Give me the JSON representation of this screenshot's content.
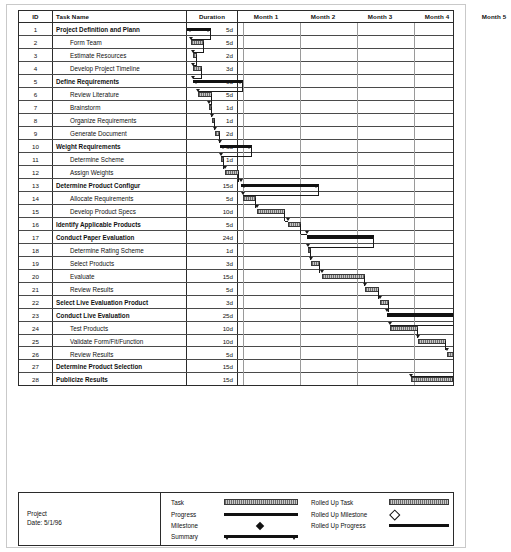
{
  "document": {
    "type": "gantt-chart",
    "project_label": "Project",
    "date_label": "Date: 5/1/96"
  },
  "table": {
    "headers": {
      "id": "ID",
      "task_name": "Task Name",
      "duration": "Duration"
    },
    "timescale": [
      "Month 1",
      "Month 2",
      "Month 3",
      "Month 4",
      "Month 5"
    ],
    "rows": [
      {
        "id": "1",
        "name": "Project Definition and Plann",
        "duration": "5d",
        "summary": true
      },
      {
        "id": "2",
        "name": "Form Team",
        "duration": "5d",
        "summary": false
      },
      {
        "id": "3",
        "name": "Estimate Resources",
        "duration": "2d",
        "summary": false
      },
      {
        "id": "4",
        "name": "Develop Project Timeline",
        "duration": "3d",
        "summary": false
      },
      {
        "id": "5",
        "name": "Define Requirements",
        "duration": "9d",
        "summary": true
      },
      {
        "id": "6",
        "name": "Review Literature",
        "duration": "5d",
        "summary": false
      },
      {
        "id": "7",
        "name": "Brainstorm",
        "duration": "1d",
        "summary": false
      },
      {
        "id": "8",
        "name": "Organize Requirements",
        "duration": "1d",
        "summary": false
      },
      {
        "id": "9",
        "name": "Generate Document",
        "duration": "2d",
        "summary": false
      },
      {
        "id": "10",
        "name": "Weight Requirements",
        "duration": "6d",
        "summary": true
      },
      {
        "id": "11",
        "name": "Determine Scheme",
        "duration": "1d",
        "summary": false
      },
      {
        "id": "12",
        "name": "Assign Weights",
        "duration": "5d",
        "summary": false
      },
      {
        "id": "13",
        "name": "Determine Product Configur",
        "duration": "15d",
        "summary": true
      },
      {
        "id": "14",
        "name": "Allocate Requirements",
        "duration": "5d",
        "summary": false
      },
      {
        "id": "15",
        "name": "Develop Product Specs",
        "duration": "10d",
        "summary": false
      },
      {
        "id": "16",
        "name": "Identify Applicable Products",
        "duration": "5d",
        "summary": true
      },
      {
        "id": "17",
        "name": "Conduct Paper Evaluation",
        "duration": "24d",
        "summary": true
      },
      {
        "id": "18",
        "name": "Determine Rating Scheme",
        "duration": "1d",
        "summary": false
      },
      {
        "id": "19",
        "name": "Select Products",
        "duration": "3d",
        "summary": false
      },
      {
        "id": "20",
        "name": "Evaluate",
        "duration": "15d",
        "summary": false
      },
      {
        "id": "21",
        "name": "Review Results",
        "duration": "5d",
        "summary": false
      },
      {
        "id": "22",
        "name": "Select Live Evaluation Product",
        "duration": "3d",
        "summary": true
      },
      {
        "id": "23",
        "name": "Conduct Live Evaluation",
        "duration": "25d",
        "summary": true
      },
      {
        "id": "24",
        "name": "Test Products",
        "duration": "10d",
        "summary": false
      },
      {
        "id": "25",
        "name": "Validate Form/Fit/Function",
        "duration": "10d",
        "summary": false
      },
      {
        "id": "26",
        "name": "Review Results",
        "duration": "5d",
        "summary": false
      },
      {
        "id": "27",
        "name": "Determine Product Selection",
        "duration": "15d",
        "summary": true
      },
      {
        "id": "28",
        "name": "Publicize Results",
        "duration": "15d",
        "summary": true
      }
    ]
  },
  "chart_data": {
    "type": "bar",
    "xlabel": "",
    "ylabel": "",
    "axis_unit": "month",
    "months": 5,
    "bars": [
      {
        "row": 1,
        "kind": "summary",
        "start_px": 0,
        "width_px": 24
      },
      {
        "row": 2,
        "kind": "task",
        "start_px": 4,
        "width_px": 13
      },
      {
        "row": 3,
        "kind": "task",
        "start_px": 6,
        "width_px": 4
      },
      {
        "row": 4,
        "kind": "task",
        "start_px": 6,
        "width_px": 9
      },
      {
        "row": 5,
        "kind": "summary",
        "start_px": 6,
        "width_px": 50
      },
      {
        "row": 6,
        "kind": "task",
        "start_px": 11,
        "width_px": 14
      },
      {
        "row": 7,
        "kind": "task",
        "start_px": 22,
        "width_px": 3
      },
      {
        "row": 8,
        "kind": "task",
        "start_px": 25,
        "width_px": 3
      },
      {
        "row": 9,
        "kind": "task",
        "start_px": 28,
        "width_px": 5
      },
      {
        "row": 10,
        "kind": "summary",
        "start_px": 33,
        "width_px": 32
      },
      {
        "row": 11,
        "kind": "task",
        "start_px": 34,
        "width_px": 3
      },
      {
        "row": 12,
        "kind": "task",
        "start_px": 38,
        "width_px": 14
      },
      {
        "row": 13,
        "kind": "summary",
        "start_px": 54,
        "width_px": 78
      },
      {
        "row": 14,
        "kind": "task",
        "start_px": 56,
        "width_px": 13
      },
      {
        "row": 15,
        "kind": "task",
        "start_px": 70,
        "width_px": 28
      },
      {
        "row": 16,
        "kind": "task",
        "start_px": 101,
        "width_px": 13
      },
      {
        "row": 17,
        "kind": "summary",
        "start_px": 120,
        "width_px": 67
      },
      {
        "row": 18,
        "kind": "task",
        "start_px": 121,
        "width_px": 3
      },
      {
        "row": 19,
        "kind": "task",
        "start_px": 124,
        "width_px": 9
      },
      {
        "row": 20,
        "kind": "task",
        "start_px": 135,
        "width_px": 43
      },
      {
        "row": 21,
        "kind": "task",
        "start_px": 178,
        "width_px": 14
      },
      {
        "row": 22,
        "kind": "task",
        "start_px": 193,
        "width_px": 9
      },
      {
        "row": 23,
        "kind": "summary",
        "start_px": 200,
        "width_px": 72
      },
      {
        "row": 24,
        "kind": "task",
        "start_px": 203,
        "width_px": 28
      },
      {
        "row": 25,
        "kind": "task",
        "start_px": 231,
        "width_px": 28
      },
      {
        "row": 26,
        "kind": "task",
        "start_px": 260,
        "width_px": 14
      },
      {
        "row": 27,
        "kind": "task",
        "start_px": 272,
        "width_px": 1
      },
      {
        "row": 28,
        "kind": "task",
        "start_px": 224,
        "width_px": 42
      }
    ]
  },
  "legend": {
    "left_column": [
      {
        "label": "Task",
        "symbol": "task-bar"
      },
      {
        "label": "Progress",
        "symbol": "progress-bar"
      },
      {
        "label": "Milestone",
        "symbol": "milestone-diamond"
      },
      {
        "label": "Summary",
        "symbol": "summary-bar"
      }
    ],
    "right_column": [
      {
        "label": "Rolled Up Task",
        "symbol": "rolled-up-task-bar"
      },
      {
        "label": "Rolled Up Milestone",
        "symbol": "rolled-up-milestone-diamond"
      },
      {
        "label": "Rolled Up Progress",
        "symbol": "rolled-up-progress-bar"
      }
    ]
  },
  "colors": {
    "ink": "#111111",
    "grid": "#2b2b2b",
    "grid_light": "#9a9a9a",
    "task_fill": "#c6c6c6",
    "summary_fill": "#111111",
    "paper": "#ffffff"
  }
}
